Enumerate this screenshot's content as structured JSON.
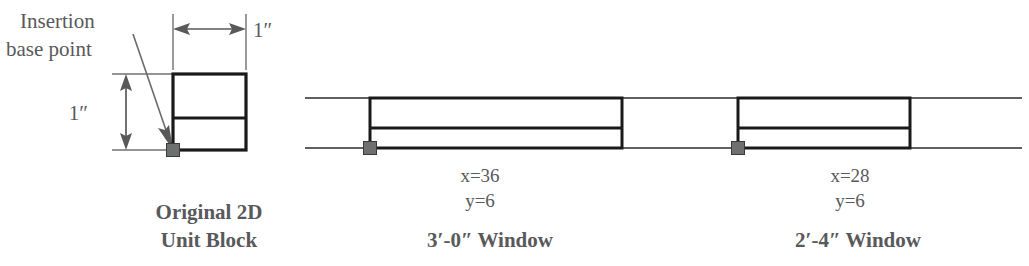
{
  "figure": {
    "kind": "technical-line-drawing",
    "background_color": "#ffffff",
    "line_color": "#1a1a1a",
    "text_color": "#58595b",
    "marker_color": "#6e6f71"
  },
  "annotations": {
    "insertion_label_line1": "Insertion",
    "insertion_label_line2": "base point",
    "width_dimension": "1″",
    "height_dimension": "1″"
  },
  "unit_block": {
    "caption_line1": "Original 2D",
    "caption_line2": "Unit Block",
    "geometry": {
      "x": 173,
      "y": 74,
      "width": 73,
      "height": 76,
      "divider_y": 118,
      "stroke_width": 3.2
    },
    "base_point": {
      "x": 173,
      "y": 150,
      "size": 13
    }
  },
  "wall": {
    "top_line_y": 98,
    "bottom_line_y": 148,
    "x_start": 305,
    "x_end": 1022
  },
  "windows": [
    {
      "name": "window-3-0",
      "caption": "3′-0″ Window",
      "scale_x": "x=36",
      "scale_y": "y=6",
      "geometry": {
        "x": 370,
        "y": 98,
        "width": 252,
        "height": 50,
        "divider_y": 128,
        "stroke_width": 3.0
      },
      "base_point": {
        "x": 370,
        "y": 148,
        "size": 13
      },
      "label_center_x": 480,
      "caption_center_x": 490
    },
    {
      "name": "window-2-4",
      "caption": "2′-4″ Window",
      "scale_x": "x=28",
      "scale_y": "y=6",
      "geometry": {
        "x": 738,
        "y": 98,
        "width": 172,
        "height": 50,
        "divider_y": 128,
        "stroke_width": 3.0
      },
      "base_point": {
        "x": 738,
        "y": 148,
        "size": 13
      },
      "label_center_x": 850,
      "caption_center_x": 858
    }
  ]
}
